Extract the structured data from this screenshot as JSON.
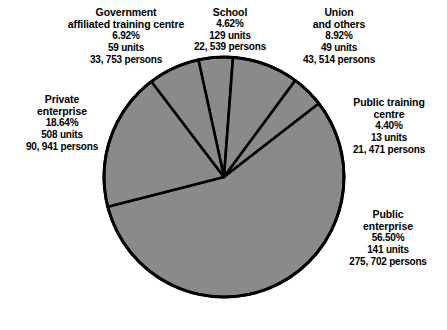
{
  "chart_data": {
    "type": "pie",
    "title": "",
    "legend_position": "outside-labels",
    "value_unit": "percent",
    "categories": [
      "School",
      "Union and others",
      "Public training centre",
      "Public enterprise",
      "Private enterprise",
      "Government affiliated training centre"
    ],
    "values": [
      4.62,
      8.92,
      4.4,
      56.5,
      18.64,
      6.92
    ],
    "units": [
      129,
      49,
      13,
      141,
      508,
      59
    ],
    "persons": [
      22539,
      43514,
      21471,
      275702,
      90941,
      33753
    ],
    "slice_color": "#8a8a8a",
    "outline_color": "#000000"
  },
  "slices": [
    {
      "id": "school",
      "title_line1": "School",
      "title_line2": "",
      "percent": "4.62%",
      "units": "129 units",
      "persons": "22, 539 persons"
    },
    {
      "id": "union",
      "title_line1": "Union",
      "title_line2": "and others",
      "percent": "8.92%",
      "units": "49 units",
      "persons": "43, 514 persons"
    },
    {
      "id": "public-training-centre",
      "title_line1": "Public training",
      "title_line2": "centre",
      "percent": "4.40%",
      "units": "13 units",
      "persons": "21, 471 persons"
    },
    {
      "id": "public-enterprise",
      "title_line1": "Public",
      "title_line2": "enterprise",
      "percent": "56.50%",
      "units": "141 units",
      "persons": "275, 702  persons"
    },
    {
      "id": "private-enterprise",
      "title_line1": "Private",
      "title_line2": "enterprise",
      "percent": "18.64%",
      "units": "508 units",
      "persons": "90, 941 persons"
    },
    {
      "id": "government-affiliated-training-centre",
      "title_line1": "Government",
      "title_line2": "affiliated training centre",
      "percent": "6.92%",
      "units": "59 units",
      "persons": "33, 753 persons"
    }
  ]
}
